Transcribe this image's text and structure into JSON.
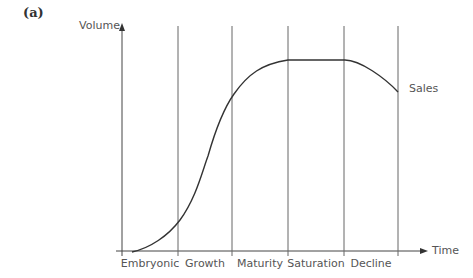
{
  "panel_label": "(a)",
  "axes": {
    "y_label": "Volume",
    "x_label": "Time"
  },
  "curve_label": "Sales",
  "stages": [
    {
      "label": "Embryonic"
    },
    {
      "label": "Growth"
    },
    {
      "label": "Maturity"
    },
    {
      "label": "Saturation"
    },
    {
      "label": "Decline"
    }
  ],
  "colors": {
    "axis": "#444444",
    "divider": "#666666",
    "curve": "#333333",
    "text": "#555555"
  }
}
